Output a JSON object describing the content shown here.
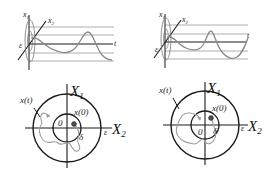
{
  "figure": {
    "type": "lyapunov-stability-illustration",
    "panels": [
      {
        "id": "left",
        "time_plot": {
          "axis_labels": {
            "x1": "x",
            "x1_sub": "1",
            "x2": "x",
            "x2_sub": "2",
            "t": "t",
            "eps": "ε"
          },
          "trajectory": "bounded-oscillation"
        },
        "phase_plane": {
          "axis_labels": {
            "x1": "X",
            "x1_sub": "1",
            "x2": "X",
            "x2_sub": "2"
          },
          "trajectory_label": "x(t)",
          "initial_label": "x(0)",
          "origin_label": "0",
          "delta_label": "δ",
          "eps_label": "ε"
        }
      },
      {
        "id": "right",
        "time_plot": {
          "axis_labels": {
            "x1": "x",
            "x1_sub": "1",
            "x2": "x",
            "x2_sub": "2",
            "t": "t",
            "eps": "ε"
          },
          "trajectory": "bounded-oscillation"
        },
        "phase_plane": {
          "axis_labels": {
            "x1": "X",
            "x1_sub": "1",
            "x2": "X",
            "x2_sub": "2"
          },
          "trajectory_label": "x(t)",
          "initial_label": "x(0)",
          "origin_label": "0",
          "delta_label": "δ",
          "eps_label": "ε"
        }
      }
    ],
    "colors": {
      "axis": "#1a1a1a",
      "grid": "#9a9a9a",
      "curve": "#8a8a8a",
      "trajectory": "#a0a0a0"
    }
  }
}
